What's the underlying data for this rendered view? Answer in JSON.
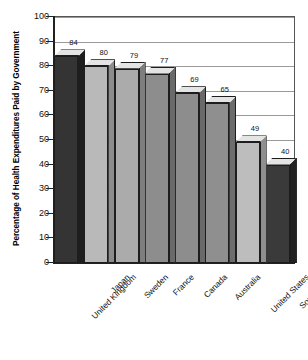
{
  "chart_data": {
    "type": "bar",
    "title": "",
    "xlabel": "",
    "ylabel": "Percentage of Health Expenditures Paid by Government",
    "ylim": [
      0,
      100
    ],
    "ytick_step": 10,
    "yticks": [
      "100",
      "90",
      "80",
      "70",
      "60",
      "50",
      "40",
      "30",
      "20",
      "10",
      "0"
    ],
    "grid": true,
    "legend": "none",
    "categories": [
      "United Kingdom",
      "Japan",
      "Sweden",
      "France",
      "Canada",
      "Australia",
      "United States",
      "South Africa"
    ],
    "values": [
      84,
      80,
      79,
      77,
      69,
      65,
      49,
      40
    ],
    "value_labels": [
      "84",
      "80",
      "79",
      "77",
      "69",
      "65",
      "49",
      "40"
    ],
    "bar_colors": [
      "#343434",
      "#b9b9b9",
      "#ababab",
      "#8d8d8d",
      "#8d8d8d",
      "#8f8f8f",
      "#bdbdbd",
      "#3a3a3a"
    ],
    "bar_side_colors": [
      "#1e1e1e",
      "#8c8c8c",
      "#7e7e7e",
      "#6a6a6a",
      "#6a6a6a",
      "#6c6c6c",
      "#8f8f8f",
      "#222222"
    ],
    "bar_top_color": "#e4e4e4",
    "grid_color": "#9a9a9a",
    "axis_color": "#222222",
    "style": "3d-bar"
  }
}
